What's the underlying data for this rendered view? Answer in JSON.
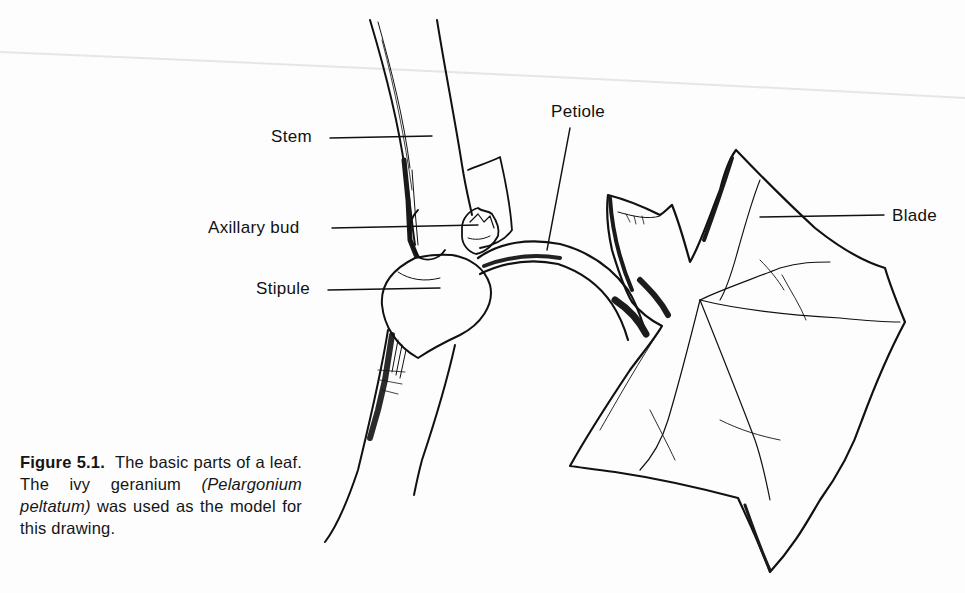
{
  "figure": {
    "labels": {
      "stem": "Stem",
      "axillary_bud": "Axillary bud",
      "stipule": "Stipule",
      "petiole": "Petiole",
      "blade": "Blade"
    },
    "caption": {
      "figure_number": "Figure 5.1.",
      "text_before": "The basic parts of a leaf. The ivy geranium ",
      "scientific_name": "(Pelargonium peltatum)",
      "text_after": " was used as the model for this drawing."
    }
  },
  "colors": {
    "ink": "#111111",
    "paper": "#fdfdfd"
  }
}
